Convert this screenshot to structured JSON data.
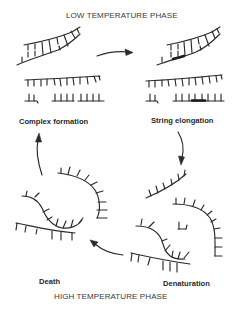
{
  "diagram": {
    "title_top": "LOW TEMPERATURE PHASE",
    "title_bottom": "HIGH TEMPERATURE PHASE",
    "stages": [
      {
        "id": "complex-formation",
        "label": "Complex formation"
      },
      {
        "id": "string-elongation",
        "label": "String elongation"
      },
      {
        "id": "denaturation",
        "label": "Denaturation"
      },
      {
        "id": "death",
        "label": "Death"
      }
    ],
    "cycle_arrows": [
      {
        "from": "complex-formation",
        "to": "string-elongation",
        "direction": "right"
      },
      {
        "from": "string-elongation",
        "to": "denaturation",
        "direction": "down"
      },
      {
        "from": "denaturation",
        "to": "death",
        "direction": "left"
      },
      {
        "from": "death",
        "to": "complex-formation",
        "direction": "up"
      }
    ],
    "colors": {
      "ink": "#2b2b2b",
      "background": "#ffffff"
    }
  }
}
